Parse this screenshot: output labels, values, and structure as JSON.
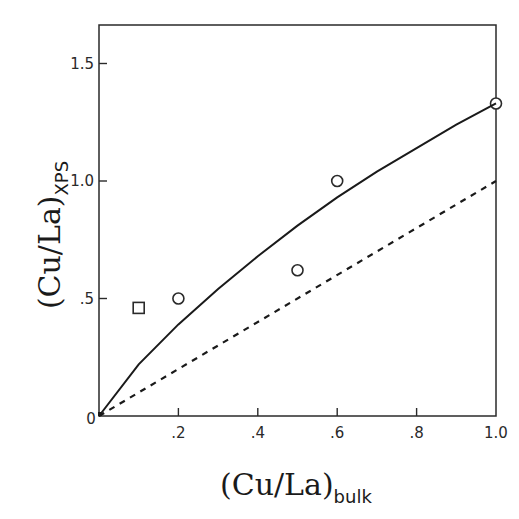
{
  "chart_data": {
    "type": "scatter",
    "title": "",
    "xlabel": "(Cu/La)",
    "xlabel_subscript": "bulk",
    "ylabel": "(Cu/La)",
    "ylabel_subscript": "XPS",
    "xlim": [
      0,
      1.0
    ],
    "ylim": [
      0,
      1.67
    ],
    "x_ticks": [
      0,
      0.2,
      0.4,
      0.6,
      0.8,
      1.0
    ],
    "x_tick_labels": [
      "0",
      ".2",
      ".4",
      ".6",
      ".8",
      "1.0"
    ],
    "y_ticks": [
      0,
      0.5,
      1.0,
      1.5
    ],
    "y_tick_labels": [
      "0",
      ".5",
      "1.0",
      "1.5"
    ],
    "grid": false,
    "legend": null,
    "series": [
      {
        "name": "circles",
        "marker": "open-circle",
        "points": [
          {
            "x": 0.2,
            "y": 0.5
          },
          {
            "x": 0.5,
            "y": 0.62
          },
          {
            "x": 0.6,
            "y": 1.0
          },
          {
            "x": 1.0,
            "y": 1.33
          }
        ]
      },
      {
        "name": "square",
        "marker": "open-square",
        "points": [
          {
            "x": 0.1,
            "y": 0.46
          }
        ]
      },
      {
        "name": "fit-curve",
        "style": "solid",
        "points": [
          {
            "x": 0.0,
            "y": 0.0
          },
          {
            "x": 0.1,
            "y": 0.22
          },
          {
            "x": 0.2,
            "y": 0.39
          },
          {
            "x": 0.3,
            "y": 0.54
          },
          {
            "x": 0.4,
            "y": 0.68
          },
          {
            "x": 0.5,
            "y": 0.81
          },
          {
            "x": 0.6,
            "y": 0.93
          },
          {
            "x": 0.7,
            "y": 1.04
          },
          {
            "x": 0.8,
            "y": 1.14
          },
          {
            "x": 0.9,
            "y": 1.24
          },
          {
            "x": 1.0,
            "y": 1.33
          }
        ]
      },
      {
        "name": "reference-line",
        "style": "dashed",
        "points": [
          {
            "x": 0.0,
            "y": 0.0
          },
          {
            "x": 1.0,
            "y": 1.0
          }
        ]
      }
    ]
  }
}
